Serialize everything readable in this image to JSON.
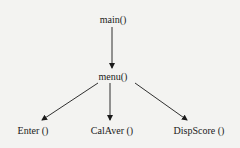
{
  "diagram": {
    "type": "call-tree",
    "nodes": [
      {
        "id": "main",
        "label": "main()"
      },
      {
        "id": "menu",
        "label": "menu()"
      },
      {
        "id": "enter",
        "label": "Enter ()"
      },
      {
        "id": "calaver",
        "label": "CalAver ()"
      },
      {
        "id": "dispscore",
        "label": "DispScore ()"
      }
    ],
    "edges": [
      {
        "from": "main",
        "to": "menu"
      },
      {
        "from": "menu",
        "to": "enter"
      },
      {
        "from": "menu",
        "to": "calaver"
      },
      {
        "from": "menu",
        "to": "dispscore"
      }
    ]
  }
}
